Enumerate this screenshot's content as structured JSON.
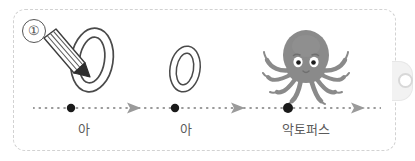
{
  "worksheet": {
    "step_number": "①",
    "frame_style": "dashed-rounded-rectangle",
    "frame_color": "#d2d2d2",
    "background_color": "#ffffff",
    "side_tab": {
      "name": "ring-tab",
      "color": "#f2f2f2",
      "hole_color": "#d8d8d8"
    }
  },
  "stages": [
    {
      "index": 1,
      "glyph": "ㅇ",
      "glyph_style": "large-double-outline-oval",
      "label": "아",
      "has_pencil": true,
      "dot_color": "#1a1a1a"
    },
    {
      "index": 2,
      "glyph": "ㅇ",
      "glyph_style": "small-double-outline-oval",
      "label": "아",
      "has_pencil": false,
      "dot_color": "#1a1a1a"
    },
    {
      "index": 3,
      "glyph": "octopus",
      "glyph_style": "gray-octopus-illustration",
      "label": "악토퍼스",
      "has_pencil": false,
      "dot_color": "#1a1a1a"
    }
  ],
  "timeline": {
    "line_style": "dotted",
    "line_color": "#7a7a7a",
    "arrow_color": "#9a9a9a",
    "arrow_count": 3,
    "dot_count": 3
  },
  "colors": {
    "octopus_body": "#8a8a8a",
    "octopus_body_dark": "#7c7c7c",
    "eye_white": "#ffffff",
    "eye_pupil": "#1c1c1c",
    "outline": "#4a4a4a",
    "label_text": "#5b5b5b",
    "pencil_outline": "#3d3d3d"
  }
}
